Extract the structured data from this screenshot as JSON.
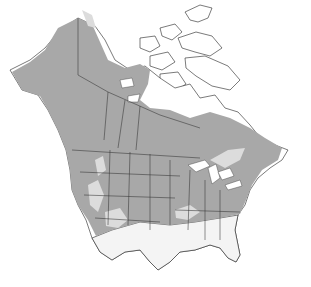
{
  "map": {
    "title": "",
    "region": "North America",
    "legend": [],
    "colors": {
      "range_primary": "#a8a8a8",
      "range_secondary": "#dcdcdc",
      "outside_range": "#f4f4f4",
      "background": "#ffffff",
      "borders": "#333333"
    },
    "layers": [
      {
        "name": "primary-range",
        "color": "#a8a8a8"
      },
      {
        "name": "secondary-range",
        "color": "#dcdcdc"
      }
    ]
  }
}
